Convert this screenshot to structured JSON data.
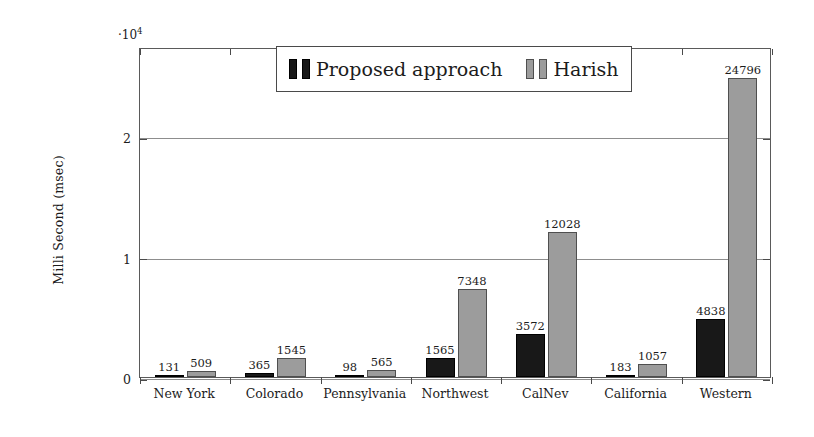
{
  "chart_data": {
    "type": "bar",
    "title": "",
    "xlabel": "",
    "ylabel": "Milli Second (msec)",
    "y_multiplier_label": "·10",
    "y_multiplier_exponent": "4",
    "categories": [
      "New York",
      "Colorado",
      "Pennsylvania",
      "Northwest",
      "CalNev",
      "California",
      "Western"
    ],
    "series": [
      {
        "name": "Proposed approach",
        "color": "#181818",
        "values": [
          131,
          365,
          98,
          1565,
          3572,
          183,
          4838
        ]
      },
      {
        "name": "Harish",
        "color": "#9c9c9c",
        "values": [
          509,
          1545,
          565,
          7348,
          12028,
          1057,
          24796
        ]
      }
    ],
    "ylim": [
      0,
      27400
    ],
    "yticks": [
      0,
      10000,
      20000
    ],
    "ytick_labels": [
      "0",
      "1",
      "2"
    ],
    "grid": "y-only-light",
    "legend_position": "top-center-inside",
    "axis_color": "#4a4a4a"
  },
  "legend": {
    "entries": [
      {
        "label": "Proposed approach"
      },
      {
        "label": "Harish"
      }
    ]
  }
}
